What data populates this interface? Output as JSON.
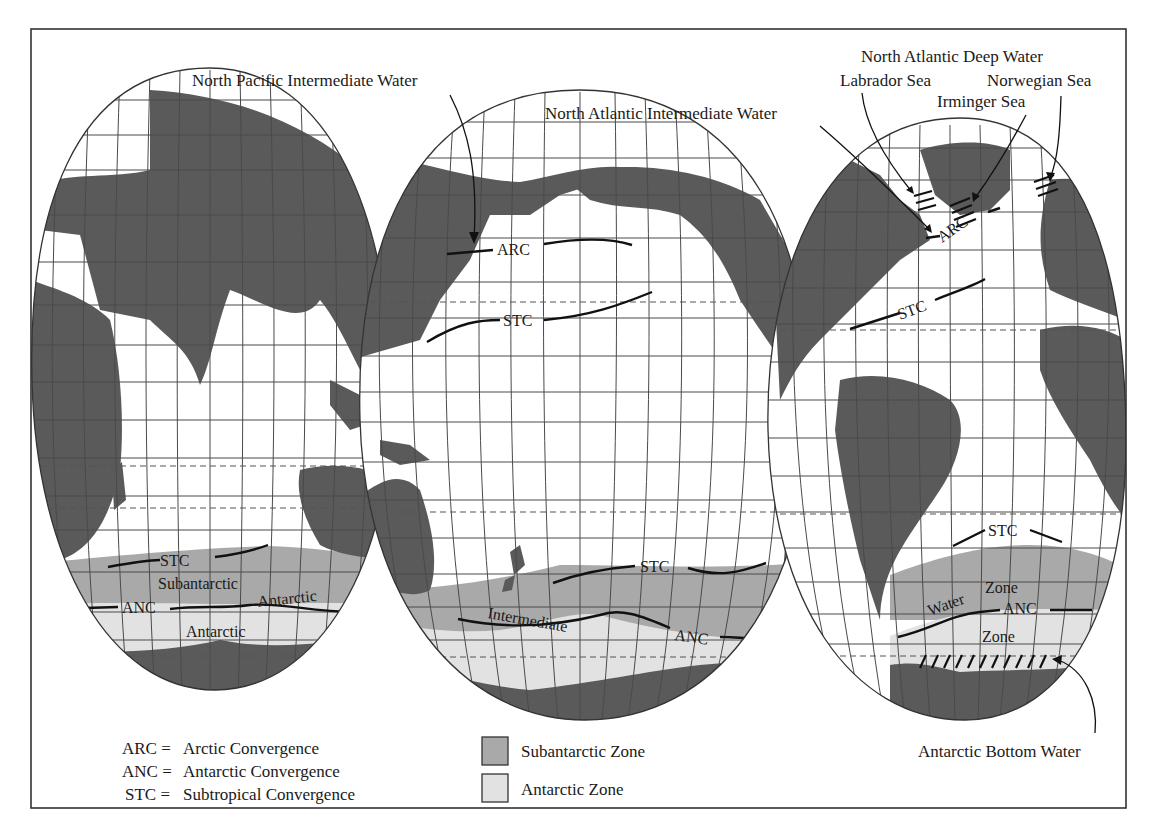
{
  "figure": {
    "type": "interrupted world map of ocean convergences and water masses",
    "colors": {
      "land": "#5a5a5a",
      "subantarctic_zone": "#a9a9a9",
      "antarctic_zone": "#e2e2e2",
      "ocean": "#ffffff",
      "lines": "#111111"
    }
  },
  "callouts": {
    "north_pacific_intermediate": "North Pacific Intermediate Water",
    "north_atlantic_intermediate": "North Atlantic Intermediate Water",
    "north_atlantic_deep": "North Atlantic Deep Water",
    "labrador_sea": "Labrador Sea",
    "norwegian_sea": "Norwegian Sea",
    "irminger_sea": "Irminger Sea",
    "antarctic_bottom": "Antarctic Bottom Water"
  },
  "map_labels": {
    "left": {
      "stc": "STC",
      "subantarctic": "Subantarctic",
      "anc": "ANC",
      "antarctic_curved": "Antarctic",
      "antarctic": "Antarctic"
    },
    "middle": {
      "arc": "ARC",
      "stc_north": "STC",
      "stc_south": "STC",
      "intermediate": "Intermediate",
      "anc": "ANC"
    },
    "right": {
      "arc": "ARC",
      "stc_north": "STC",
      "stc_south": "STC",
      "zone_upper": "Zone",
      "water": "Water",
      "anc": "ANC",
      "zone_lower": "Zone"
    }
  },
  "legend": {
    "abbreviations": [
      {
        "abbr": "ARC =",
        "meaning": "Arctic Convergence"
      },
      {
        "abbr": "ANC =",
        "meaning": "Antarctic Convergence"
      },
      {
        "abbr": "STC =",
        "meaning": "Subtropical Convergence"
      }
    ],
    "swatches": [
      {
        "label": "Subantarctic Zone",
        "color": "#a9a9a9"
      },
      {
        "label": "Antarctic Zone",
        "color": "#e2e2e2"
      }
    ]
  }
}
